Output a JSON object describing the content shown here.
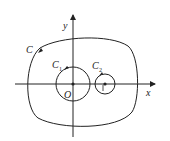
{
  "diagram": {
    "axes": {
      "x_label": "x",
      "y_label": "y",
      "origin_label": "O"
    },
    "curves": [
      {
        "name": "C",
        "label": "C",
        "description": "large closed curve enclosing origin and C2"
      },
      {
        "name": "C1",
        "label": "C",
        "subscript": "1",
        "center": "O",
        "description": "circle centered at origin"
      },
      {
        "name": "C2",
        "label": "C",
        "subscript": "2",
        "center_label": "1",
        "description": "small circle centered at (1,0)"
      }
    ],
    "tick_label": "1"
  }
}
